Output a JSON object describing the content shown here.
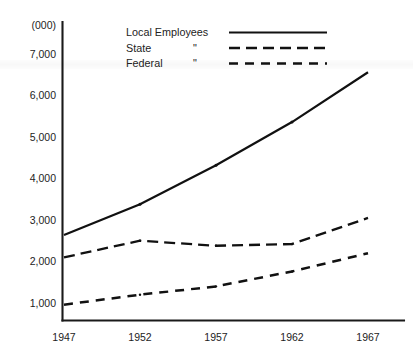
{
  "chart_data": {
    "type": "line",
    "title": "",
    "subtitle": "",
    "xlabel": "",
    "ylabel": "",
    "unit_label": "(000)",
    "x": [
      1947,
      1952,
      1957,
      1962,
      1967
    ],
    "categories": [
      "1947",
      "1952",
      "1957",
      "1962",
      "1967"
    ],
    "xlim": [
      1947,
      1967
    ],
    "ylim": [
      0,
      7400
    ],
    "y_ticks": [
      1000,
      2000,
      3000,
      4000,
      5000,
      6000,
      7000
    ],
    "y_tick_labels": [
      "1,000",
      "2,000",
      "3,000",
      "4,000",
      "5,000",
      "6,000",
      "7,000"
    ],
    "x_tick_labels": [
      "1947",
      "1952",
      "1957",
      "1962",
      "1967"
    ],
    "grid": false,
    "legend_position": "top-center",
    "series": [
      {
        "name": "Local Employees",
        "legend_label": "Local Employees",
        "legend_ditto": "",
        "style": "solid",
        "color": "#111111",
        "values": [
          2640,
          3380,
          4320,
          5360,
          6560
        ]
      },
      {
        "name": "State",
        "legend_label": "State",
        "legend_ditto": "\"",
        "style": "long-dash",
        "color": "#111111",
        "values": [
          2100,
          2500,
          2380,
          2420,
          3050
        ]
      },
      {
        "name": "Federal",
        "legend_label": "Federal",
        "legend_ditto": "\"",
        "style": "dash",
        "color": "#111111",
        "values": [
          960,
          1200,
          1400,
          1760,
          2200
        ]
      }
    ]
  },
  "legend": {
    "entries": [
      {
        "label": "Local Employees",
        "ditto": ""
      },
      {
        "label": "State",
        "ditto": "\""
      },
      {
        "label": "Federal",
        "ditto": "\""
      }
    ]
  },
  "axes": {
    "unit_label": "(000)",
    "y_labels": [
      "7,000",
      "6,000",
      "5,000",
      "4,000",
      "3,000",
      "2,000",
      "1,000"
    ],
    "x_labels": [
      "1947",
      "1952",
      "1957",
      "1962",
      "1967"
    ]
  }
}
